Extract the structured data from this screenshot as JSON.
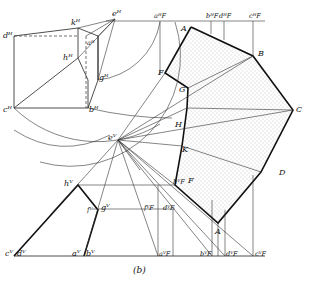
{
  "figure": {
    "caption": "(b)",
    "colors": {
      "ink": "#111111",
      "background": "#ffffff",
      "stipple": "#888888"
    }
  },
  "top_view_labels": {
    "d_h": "dᴴ",
    "k_h": "kᴴ",
    "e_h": "eᴴ",
    "a_h": "aᴴ",
    "h_h": "hᴴ",
    "g_h": "gᴴ",
    "c_h": "cᴴ",
    "b_h": "bᴴ",
    "a_F_h": "aᴴF",
    "b_F_h": "bᴴF",
    "d_F_h": "dᴴF",
    "c_F_h": "cᴴF"
  },
  "front_view_labels": {
    "e_v": "eⱽ",
    "h_v": "hⱽ",
    "f_v": "fⱽ",
    "g_v": "gⱽ",
    "c_v": "cⱽ",
    "d_v": "dⱽ",
    "a_v": "aⱽ",
    "b_v": "bⱽ",
    "f_F_v": "fⱽF",
    "d_F_v": "dⱽF",
    "a_F_v": "aⱽF",
    "b_F_v": "bⱽF",
    "d_F_v2": "dⱽF",
    "c_F_v": "cⱽF",
    "h_F": "hⱽF"
  },
  "shadow_polygon_labels": {
    "A_top": "A",
    "B": "B",
    "C": "C",
    "D": "D",
    "A_bottom": "A",
    "F_top": "F",
    "G": "G",
    "H": "H",
    "K": "K",
    "F_bottom": "F"
  }
}
